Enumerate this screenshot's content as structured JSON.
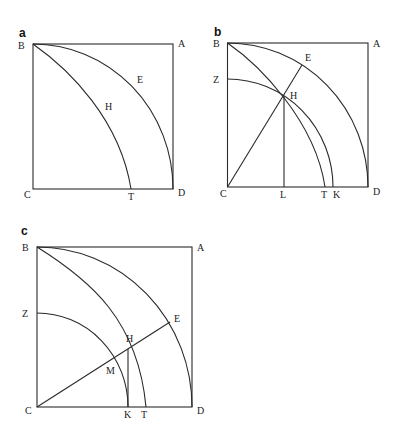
{
  "figure": {
    "panels": [
      {
        "id": "a",
        "panel_label": "a",
        "points": {
          "B": "B",
          "A": "A",
          "E": "E",
          "H": "H",
          "C": "C",
          "T": "T",
          "D": "D"
        },
        "elements": [
          "square BACD",
          "quarter arc BED centered at C",
          "quadratrix BHT"
        ]
      },
      {
        "id": "b",
        "panel_label": "b",
        "points": {
          "B": "B",
          "A": "A",
          "E": "E",
          "Z": "Z",
          "H": "H",
          "C": "C",
          "L": "L",
          "T": "T",
          "K": "K",
          "D": "D"
        },
        "elements": [
          "square BACD",
          "quarter arc BED centered at C",
          "quadratrix BHT",
          "arc ZHK centered at C",
          "line CHE",
          "perpendicular HL"
        ]
      },
      {
        "id": "c",
        "panel_label": "c",
        "points": {
          "B": "B",
          "A": "A",
          "Z": "Z",
          "E": "E",
          "H": "H",
          "M": "M",
          "C": "C",
          "K": "K",
          "T": "T",
          "D": "D"
        },
        "elements": [
          "square BACD",
          "quarter arc BED centered at C",
          "quadratrix BHT",
          "arc ZMK centered at C",
          "line CMHE",
          "perpendicular HK"
        ]
      }
    ],
    "colors": {
      "stroke": "#2a2a2a",
      "background": "#ffffff"
    }
  }
}
